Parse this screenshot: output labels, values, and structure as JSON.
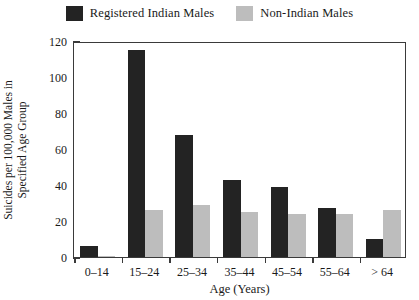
{
  "chart_data": {
    "type": "bar",
    "title": "",
    "xlabel": "Age (Years)",
    "ylabel_line1": "Suicides per 100,000 Males in",
    "ylabel_line2": "Specified Age Group",
    "categories": [
      "0–14",
      "15–24",
      "25–34",
      "35–44",
      "45–54",
      "55–64",
      "> 64"
    ],
    "series": [
      {
        "name": "Registered Indian Males",
        "color": "#232323",
        "values": [
          6,
          115,
          68,
          43,
          39,
          27,
          10
        ]
      },
      {
        "name": "Non-Indian Males",
        "color": "#bdbdbd",
        "values": [
          0.5,
          26,
          29,
          25,
          24,
          24,
          26
        ]
      }
    ],
    "ylim": [
      0,
      120
    ],
    "yticks": [
      0,
      20,
      40,
      60,
      80,
      100,
      120
    ],
    "ytick_labels": [
      "0",
      "20",
      "40",
      "60",
      "80",
      "100",
      "120"
    ],
    "grid": false,
    "legend_position": "top-center"
  }
}
